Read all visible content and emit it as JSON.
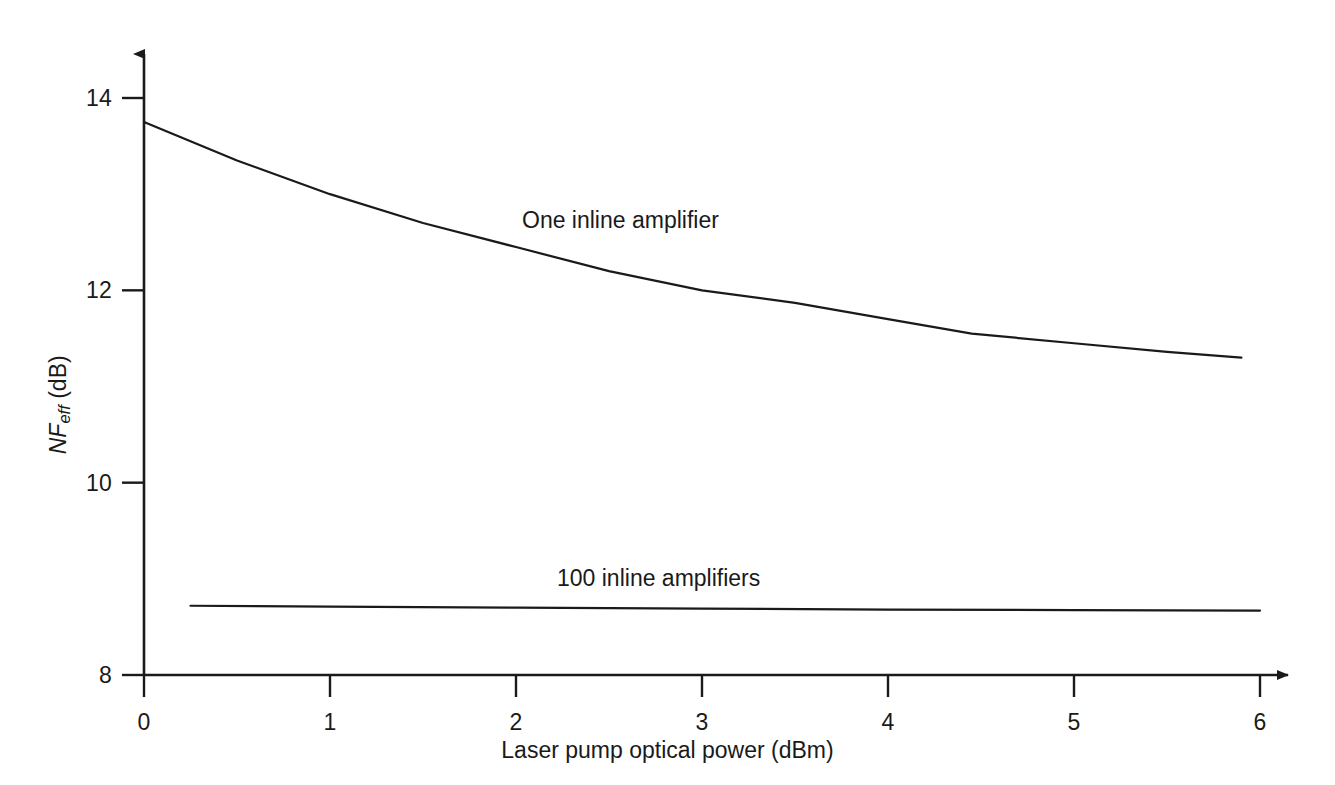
{
  "chart_data": {
    "type": "line",
    "title": "",
    "xlabel": "Laser pump optical power (dBm)",
    "ylabel": "NF_eff (dB)",
    "ylabel_parts": {
      "symbol": "NF",
      "subscript": "eff",
      "unit": "(dB)"
    },
    "xlim": [
      0,
      6
    ],
    "ylim": [
      8,
      14.6
    ],
    "xticks": [
      0,
      1,
      2,
      3,
      4,
      5,
      6
    ],
    "xtick_labels": [
      "0",
      "1",
      "2",
      "3",
      "4",
      "5",
      "6"
    ],
    "yticks": [
      8,
      10,
      12,
      14
    ],
    "ytick_labels": [
      "8",
      "10",
      "12",
      "14"
    ],
    "grid": false,
    "legend_position": "inline-annotations",
    "axis_style": "arrow-tipped-open-axes",
    "line_color": "#1a1a1a",
    "background_color": "#ffffff",
    "series": [
      {
        "name": "One inline amplifier",
        "label_x": 2.9,
        "label_y": 12.72,
        "x": [
          0,
          0.5,
          1,
          1.5,
          2,
          2.5,
          3,
          3.5,
          4,
          4.45,
          5,
          5.5,
          5.9
        ],
        "values": [
          13.75,
          13.35,
          13.0,
          12.7,
          12.45,
          12.2,
          12.0,
          11.87,
          11.7,
          11.55,
          11.45,
          11.36,
          11.3
        ]
      },
      {
        "name": "100 inline amplifiers",
        "label_x": 2.95,
        "label_y": 9.05,
        "x": [
          0.25,
          1,
          2,
          3,
          4,
          5,
          6
        ],
        "values": [
          8.72,
          8.71,
          8.7,
          8.69,
          8.68,
          8.675,
          8.67
        ]
      }
    ]
  },
  "annotations": {
    "series_labels": [
      "One inline amplifier",
      "100 inline amplifiers"
    ]
  }
}
